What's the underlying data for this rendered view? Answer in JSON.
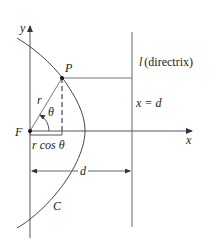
{
  "figure": {
    "type": "polar-conic-diagram",
    "colors": {
      "line": "#555555",
      "text": "#222222",
      "background": "#ffffff"
    }
  },
  "labels": {
    "y_axis": "y",
    "x_axis": "x",
    "point_p": "P",
    "focus": "F",
    "radius": "r",
    "angle": "θ",
    "projection": "r cos θ",
    "distance": "d",
    "curve": "C",
    "directrix_letter": "l",
    "directrix_text": "(directrix)",
    "directrix_equation": "x = d"
  }
}
